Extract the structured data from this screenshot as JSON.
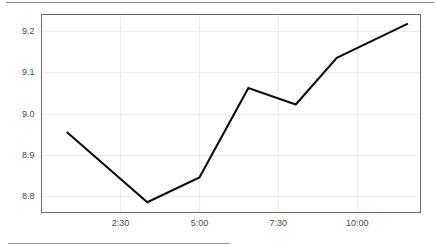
{
  "chart_data": {
    "type": "line",
    "title": "",
    "subtitle": "",
    "xlabel": "",
    "ylabel": "",
    "grid": true,
    "legend": false,
    "legend_position": "none",
    "xlim": [
      0.0,
      12.0
    ],
    "ylim": [
      8.76,
      9.24
    ],
    "ytick_labels": [
      "9.2",
      "9.1",
      "9.0",
      "8.9",
      "8.8"
    ],
    "ytick_values": [
      9.2,
      9.1,
      9.0,
      8.9,
      8.8
    ],
    "xtick_labels": [
      "2:30",
      "5:00",
      "7:30",
      "10:00"
    ],
    "xtick_values": [
      2.5,
      5.0,
      7.5,
      10.0
    ],
    "series": [
      {
        "name": "value",
        "color": "#0d0d0d",
        "x": [
          0.8,
          2.5,
          3.35,
          5.0,
          6.55,
          7.5,
          9.05,
          10.0,
          11.6
        ],
        "values": [
          8.955,
          8.868,
          8.785,
          8.825,
          8.845,
          9.062,
          9.022,
          9.135,
          9.218
        ]
      }
    ],
    "points": [
      {
        "x": 0.8,
        "y": 8.955
      },
      {
        "x": 3.35,
        "y": 8.785
      },
      {
        "x": 5.0,
        "y": 8.845
      },
      {
        "x": 6.55,
        "y": 9.062
      },
      {
        "x": 8.05,
        "y": 9.022
      },
      {
        "x": 9.35,
        "y": 9.135
      },
      {
        "x": 11.6,
        "y": 9.218
      }
    ],
    "line_color": "#0d0d0d",
    "grid_color": "#e9eef2",
    "frame_color": "#6b6b6b",
    "background": "#ffffff",
    "tick_text_color": "#4a4a4a"
  },
  "axes": {
    "y_ticks": [
      {
        "label": "9.2",
        "value": 9.2
      },
      {
        "label": "9.1",
        "value": 9.1
      },
      {
        "label": "9.0",
        "value": 9.0
      },
      {
        "label": "8.9",
        "value": 8.9
      },
      {
        "label": "8.8",
        "value": 8.8
      }
    ],
    "x_ticks": [
      {
        "label": "2:30",
        "value": 2.5
      },
      {
        "label": "5:00",
        "value": 5.0
      },
      {
        "label": "7:30",
        "value": 7.5
      },
      {
        "label": "10:00",
        "value": 10.0
      }
    ]
  }
}
